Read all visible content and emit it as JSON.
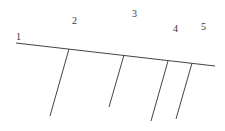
{
  "diagram": {
    "line_color": "#444444",
    "label_color": "#333333",
    "main_line": {
      "x1": 16,
      "y1": 43,
      "x2": 215,
      "y2": 66
    },
    "labels": [
      {
        "text": "1",
        "x": 16,
        "y": 40
      },
      {
        "text": "2",
        "x": 72,
        "y": 24
      },
      {
        "text": "3",
        "x": 132,
        "y": 17
      },
      {
        "text": "4",
        "x": 173,
        "y": 32
      },
      {
        "text": "5",
        "x": 201,
        "y": 30
      }
    ],
    "branches": [
      {
        "x1": 69,
        "y1": 49,
        "x2": 50,
        "y2": 116
      },
      {
        "x1": 124,
        "y1": 55,
        "x2": 109,
        "y2": 107
      },
      {
        "x1": 168,
        "y1": 61,
        "x2": 151,
        "y2": 121
      },
      {
        "x1": 192,
        "y1": 63,
        "x2": 176,
        "y2": 119
      }
    ]
  }
}
